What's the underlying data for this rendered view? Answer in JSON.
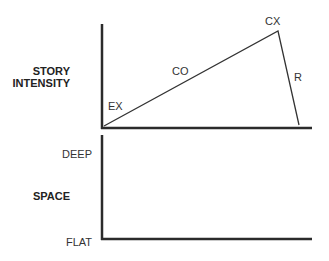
{
  "top_panel": {
    "y_axis_label_line1": "STORY",
    "y_axis_label_line2": "INTENSITY",
    "segments": [
      {
        "label": "EX",
        "name": "exposition"
      },
      {
        "label": "CO",
        "name": "conflict"
      },
      {
        "label": "CX",
        "name": "climax"
      },
      {
        "label": "R",
        "name": "resolution"
      }
    ]
  },
  "bottom_panel": {
    "y_axis_label": "SPACE",
    "y_top_tick": "DEEP",
    "y_bottom_tick": "FLAT"
  },
  "colors": {
    "line": "#2b2b2b",
    "text": "#333333"
  }
}
